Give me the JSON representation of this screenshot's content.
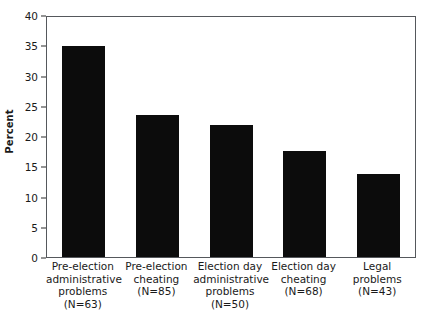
{
  "chart_data": {
    "type": "bar",
    "title": "",
    "xlabel": "",
    "ylabel": "Percent",
    "ylim": [
      0,
      40
    ],
    "yticks": [
      0,
      5,
      10,
      15,
      20,
      25,
      30,
      35,
      40
    ],
    "ytick_labels": [
      "0",
      "5",
      "10",
      "15",
      "20",
      "25",
      "30",
      "35",
      "40"
    ],
    "grid": false,
    "legend": false,
    "bar_color": "#0c0c0c",
    "categories": [
      "Pre-election administrative problems (N=63)",
      "Pre-election cheating (N=85)",
      "Election day administrative problems (N=50)",
      "Election day cheating (N=68)",
      "Legal problems (N=43)"
    ],
    "category_lines": [
      [
        "Pre-election",
        "administrative",
        "problems",
        "(N=63)"
      ],
      [
        "Pre-election",
        "cheating",
        "(N=85)"
      ],
      [
        "Election day",
        "administrative",
        "problems",
        "(N=50)"
      ],
      [
        "Election day",
        "cheating",
        "(N=68)"
      ],
      [
        "Legal",
        "problems",
        "(N=43)"
      ]
    ],
    "n_values": [
      63,
      85,
      50,
      68,
      43
    ],
    "values": [
      34.8,
      23.4,
      21.8,
      17.5,
      13.7
    ]
  }
}
